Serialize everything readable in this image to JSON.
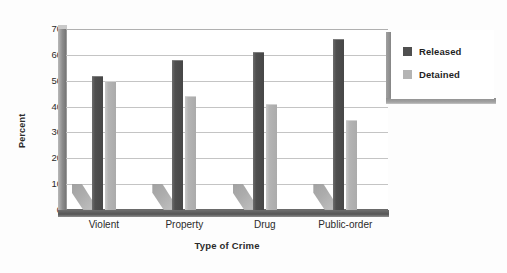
{
  "chart_data": {
    "type": "bar",
    "title": "",
    "xlabel": "Type of Crime",
    "ylabel": "Percent",
    "categories": [
      "Violent",
      "Property",
      "Drug",
      "Public-order"
    ],
    "series": [
      {
        "name": "Released",
        "color": "#4f4f4f",
        "values": [
          52,
          58,
          61,
          66
        ]
      },
      {
        "name": "Detained",
        "color": "#b4b4b4",
        "values": [
          50,
          44,
          41,
          35
        ]
      }
    ],
    "ylim": [
      0,
      70
    ],
    "yticks": [
      0,
      10,
      20,
      30,
      40,
      50,
      60,
      70
    ],
    "ytick_labels": [
      "0",
      "10",
      "20",
      "30",
      "40",
      "50",
      "60",
      "70"
    ],
    "grid": true,
    "legend_position": "right",
    "style": "3d-shadow-bars"
  },
  "legend": {
    "items": [
      {
        "label": "Released",
        "swatch": "released"
      },
      {
        "label": "Detained",
        "swatch": "detained"
      }
    ]
  },
  "axes": {
    "y_title": "Percent",
    "x_title": "Type of Crime"
  }
}
